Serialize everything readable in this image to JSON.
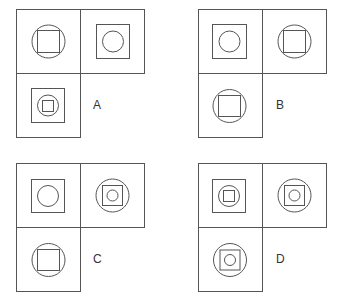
{
  "diagram": {
    "stroke_color": "#555555",
    "cell_size": 64,
    "options": [
      {
        "label": "A",
        "origin": [
          16,
          9
        ],
        "label_pos": [
          95,
          105
        ],
        "cells": [
          {
            "position": "top-left",
            "figure": "circle containing square",
            "layers": [
              "circle",
              "square"
            ]
          },
          {
            "position": "top-right",
            "figure": "square containing circle",
            "layers": [
              "square",
              "circle"
            ]
          },
          {
            "position": "bottom-left",
            "figure": "square containing circle containing square",
            "layers": [
              "square",
              "circle",
              "square"
            ]
          }
        ]
      },
      {
        "label": "B",
        "origin": [
          198,
          9
        ],
        "label_pos": [
          278,
          105
        ],
        "cells": [
          {
            "position": "top-left",
            "figure": "square containing circle",
            "layers": [
              "square",
              "circle"
            ]
          },
          {
            "position": "top-right",
            "figure": "circle containing square",
            "layers": [
              "circle",
              "square"
            ]
          },
          {
            "position": "bottom-left",
            "figure": "circle containing square",
            "layers": [
              "circle",
              "square"
            ]
          }
        ]
      },
      {
        "label": "C",
        "origin": [
          16,
          163
        ],
        "label_pos": [
          95,
          259
        ],
        "cells": [
          {
            "position": "top-left",
            "figure": "square containing circle",
            "layers": [
              "square",
              "circle"
            ]
          },
          {
            "position": "top-right",
            "figure": "circle containing square containing circle",
            "layers": [
              "circle",
              "square",
              "circle"
            ]
          },
          {
            "position": "bottom-left",
            "figure": "circle containing square",
            "layers": [
              "circle",
              "square"
            ]
          }
        ]
      },
      {
        "label": "D",
        "origin": [
          198,
          163
        ],
        "label_pos": [
          278,
          259
        ],
        "cells": [
          {
            "position": "top-left",
            "figure": "square containing circle containing square",
            "layers": [
              "square",
              "circle",
              "square"
            ]
          },
          {
            "position": "top-right",
            "figure": "circle containing square containing circle",
            "layers": [
              "circle",
              "square",
              "circle"
            ]
          },
          {
            "position": "bottom-left",
            "figure": "circle containing square containing circle",
            "layers": [
              "circle",
              "square",
              "circle"
            ]
          }
        ]
      }
    ]
  }
}
